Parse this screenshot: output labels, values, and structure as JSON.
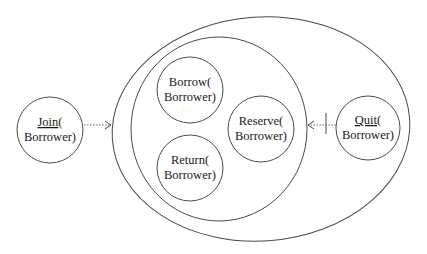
{
  "diagram": {
    "type": "use-case-scope",
    "outer_scope": {
      "label": ""
    },
    "inner_scope": {
      "label": ""
    },
    "nodes": [
      {
        "id": "join",
        "line1": "Join",
        "line1_suffix": "(",
        "line2": "Borrower)",
        "underlined": true,
        "position": "outside-left"
      },
      {
        "id": "borrow",
        "line1": "Borrow(",
        "line1_suffix": "",
        "line2": "Borrower)",
        "underlined": false,
        "position": "inner-top-left"
      },
      {
        "id": "return",
        "line1": "Return(",
        "line1_suffix": "",
        "line2": "Borrower)",
        "underlined": false,
        "position": "inner-bottom-left"
      },
      {
        "id": "reserve",
        "line1": "Reserve(",
        "line1_suffix": "",
        "line2": "Borrower)",
        "underlined": false,
        "position": "inner-right"
      },
      {
        "id": "quit",
        "line1": "Quit",
        "line1_suffix": "(",
        "line2": "Borrower)",
        "underlined": true,
        "position": "outer-right"
      }
    ],
    "edges": [
      {
        "from": "join",
        "to": "outer_scope",
        "style": "dotted",
        "arrowhead": "open"
      },
      {
        "from": "quit",
        "to": "inner_scope",
        "style": "dotted",
        "arrowhead": "open",
        "crossbar": true
      }
    ],
    "colors": {
      "stroke": "#4a4a4a",
      "text": "#1a1a1a",
      "background": "#ffffff"
    }
  }
}
